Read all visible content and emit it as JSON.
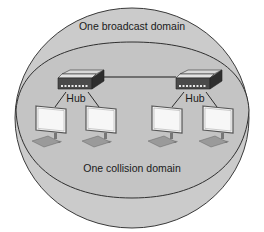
{
  "diagram": {
    "broadcast_domain_label": "One broadcast domain",
    "collision_domain_label": "One collision domain",
    "hubs": [
      {
        "label": "Hub"
      },
      {
        "label": "Hub"
      }
    ],
    "computers_count": 4,
    "colors": {
      "sphere_fill": "#c9c9c9",
      "sphere_stroke": "#3a3a3a",
      "band_fill": "#c2c2c2",
      "hub_top": "#d9d9d9",
      "hub_front": "#4a4a4a",
      "hub_side": "#2e2e2e",
      "port_color": "#e8e8e8",
      "monitor_screen": "#f4f4f4",
      "monitor_frame": "#555555",
      "keyboard": "#9a9a9a",
      "link_line": "#1a1a1a"
    }
  }
}
